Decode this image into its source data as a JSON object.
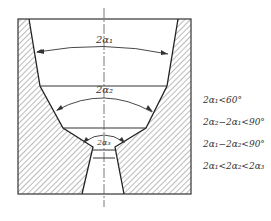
{
  "diagram": {
    "type": "cross-section drawing of conical die with three taper angles",
    "angle_labels": [
      {
        "id": "alpha1",
        "text": "2α₁"
      },
      {
        "id": "alpha2",
        "text": "2α₂"
      },
      {
        "id": "alpha3",
        "text": "2α₃"
      }
    ],
    "conditions": [
      "2α₁<60°",
      "2α₂−2α₁<90°",
      "2α₁−2α₂<90°",
      "2α₁<2α₂<2α₃"
    ],
    "colors": {
      "line": "#333333",
      "hatch": "#555555",
      "background": "#ffffff"
    }
  }
}
